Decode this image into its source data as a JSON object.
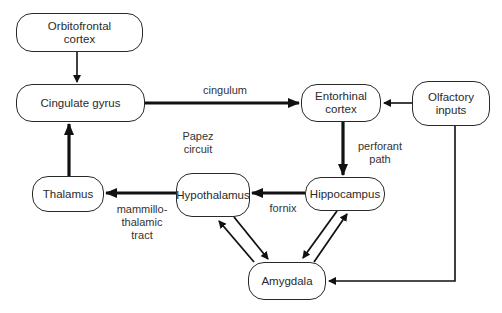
{
  "diagram": {
    "nodes": [
      {
        "id": "orbitofrontal",
        "label": "Orbitofrontal\ncortex"
      },
      {
        "id": "cingulate",
        "label": "Cingulate gyrus"
      },
      {
        "id": "entorhinal",
        "label": "Entorhinal\ncortex"
      },
      {
        "id": "olfactory",
        "label": "Olfactory\ninputs"
      },
      {
        "id": "thalamus",
        "label": "Thalamus"
      },
      {
        "id": "hypothalamus",
        "label": "Hypothalamus"
      },
      {
        "id": "hippocampus",
        "label": "Hippocampus"
      },
      {
        "id": "amygdala",
        "label": "Amygdala"
      }
    ],
    "edge_labels": {
      "cingulum": "cingulum",
      "papez": "Papez\ncircuit",
      "perforant": "perforant\npath",
      "fornix": "fornix",
      "mammillothalamic": "mammillo-\nthalamic\ntract"
    },
    "edges": [
      {
        "from": "orbitofrontal",
        "to": "cingulate",
        "label": ""
      },
      {
        "from": "cingulate",
        "to": "entorhinal",
        "label": "cingulum"
      },
      {
        "from": "olfactory",
        "to": "entorhinal",
        "label": ""
      },
      {
        "from": "entorhinal",
        "to": "hippocampus",
        "label": "perforant path"
      },
      {
        "from": "hippocampus",
        "to": "hypothalamus",
        "label": "fornix"
      },
      {
        "from": "hypothalamus",
        "to": "thalamus",
        "label": "mammillo-thalamic tract"
      },
      {
        "from": "thalamus",
        "to": "cingulate",
        "label": ""
      },
      {
        "from": "hypothalamus",
        "to": "amygdala",
        "label": ""
      },
      {
        "from": "amygdala",
        "to": "hypothalamus",
        "label": ""
      },
      {
        "from": "hippocampus",
        "to": "amygdala",
        "label": ""
      },
      {
        "from": "amygdala",
        "to": "hippocampus",
        "label": ""
      },
      {
        "from": "olfactory",
        "to": "amygdala",
        "label": ""
      }
    ]
  }
}
